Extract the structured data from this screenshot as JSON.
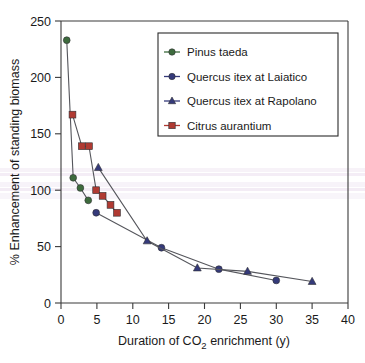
{
  "chart_data": {
    "type": "scatter",
    "title": "",
    "xlabel": "Duration of CO2 enrichment (y)",
    "xlabel_parts": {
      "pre": "Duration of CO",
      "sub": "2",
      "post": " enrichment (y)"
    },
    "ylabel": "% Enhancement of standing biomass",
    "xlim": [
      0,
      40
    ],
    "ylim": [
      0,
      250
    ],
    "xticks": [
      "0",
      "5",
      "10",
      "15",
      "20",
      "25",
      "30",
      "35",
      "40"
    ],
    "yticks": [
      "0",
      "50",
      "100",
      "150",
      "200",
      "250"
    ],
    "grid": false,
    "legend_position": "top-right",
    "series": [
      {
        "name": "Pinus taeda",
        "marker": "circle",
        "color": "#3d6b3d",
        "x": [
          0.8,
          1.7,
          2.7,
          3.8
        ],
        "y": [
          233,
          111,
          102,
          91
        ]
      },
      {
        "name": "Quercus itex at Laiatico",
        "marker": "circle",
        "color": "#353a7a",
        "x": [
          4.9,
          14.0,
          22.0,
          30.0
        ],
        "y": [
          80,
          49,
          30,
          20
        ]
      },
      {
        "name": "Quercus itex at Rapolano",
        "marker": "triangle",
        "color": "#353a7a",
        "x": [
          5.2,
          12.0,
          19.0,
          26.0,
          35.0
        ],
        "y": [
          120,
          55,
          31,
          28,
          19
        ]
      },
      {
        "name": "Citrus aurantium",
        "marker": "square",
        "color": "#b03a32",
        "x": [
          1.6,
          2.9,
          3.9,
          4.9,
          5.8,
          6.9,
          7.8
        ],
        "y": [
          167,
          139,
          139,
          100,
          95,
          87,
          80
        ]
      }
    ]
  },
  "legend": {
    "items": [
      {
        "label": "Pinus taeda",
        "marker": "circle",
        "color": "#3d6b3d"
      },
      {
        "label": "Quercus itex at Laiatico",
        "marker": "circle",
        "color": "#353a7a"
      },
      {
        "label": "Quercus itex at Rapolano",
        "marker": "triangle",
        "color": "#353a7a"
      },
      {
        "label": "Citrus aurantium",
        "marker": "square",
        "color": "#b03a32"
      }
    ]
  },
  "colors": {
    "pinus": "#3d6b3d",
    "quercus": "#353a7a",
    "citrus": "#b03a32",
    "line": "#55565c",
    "axis": "#3a3a3a"
  }
}
